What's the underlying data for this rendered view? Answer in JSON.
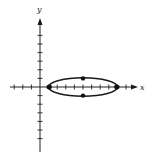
{
  "diagram": {
    "type": "ellipse-graph",
    "axes": {
      "x_label": "x",
      "y_label": "y",
      "x_ticks": [
        -3,
        -2,
        -1,
        1,
        2,
        3,
        4,
        5,
        6,
        7,
        8,
        9,
        10
      ],
      "y_ticks": [
        -6,
        -5,
        -4,
        -3,
        -2,
        -1,
        1,
        2,
        3,
        4,
        5,
        6
      ]
    },
    "ellipse": {
      "center": [
        5,
        0
      ],
      "a": 4,
      "b": 1,
      "vertices": [
        [
          1,
          0
        ],
        [
          9,
          0
        ]
      ],
      "co_vertices": [
        [
          5,
          1
        ],
        [
          5,
          -1
        ]
      ],
      "foci": [
        [
          1.13,
          0
        ],
        [
          8.87,
          0
        ]
      ]
    },
    "colors": {
      "stroke": "#1a1a1a",
      "background": "#ffffff"
    }
  }
}
